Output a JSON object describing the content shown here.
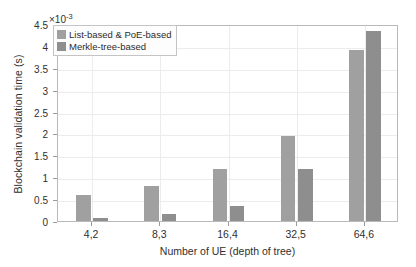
{
  "chart_data": {
    "type": "bar",
    "title": "",
    "xlabel": "Number of UE (depth of tree)",
    "ylabel": "Blockchain validation time (s)",
    "y_multiplier": "×10",
    "y_multiplier_exponent": "-3",
    "categories": [
      "4,2",
      "8,3",
      "16,4",
      "32,5",
      "64,6"
    ],
    "series": [
      {
        "name": "List-based & PoE-based",
        "color": "#a0a0a0",
        "values": [
          0.6,
          0.8,
          1.2,
          1.95,
          3.9
        ]
      },
      {
        "name": "Merkle-tree-based",
        "color": "#8e8e8e",
        "values": [
          0.08,
          0.15,
          0.35,
          1.2,
          4.35
        ]
      }
    ],
    "ylim": [
      0,
      4.5
    ],
    "yticks": [
      0,
      0.5,
      1,
      1.5,
      2,
      2.5,
      3,
      3.5,
      4,
      4.5
    ],
    "ytick_labels": [
      "0",
      "0.5",
      "1",
      "1.5",
      "2",
      "2.5",
      "3",
      "3.5",
      "4",
      "4.5"
    ],
    "grid": true,
    "legend_position": "top-left"
  }
}
